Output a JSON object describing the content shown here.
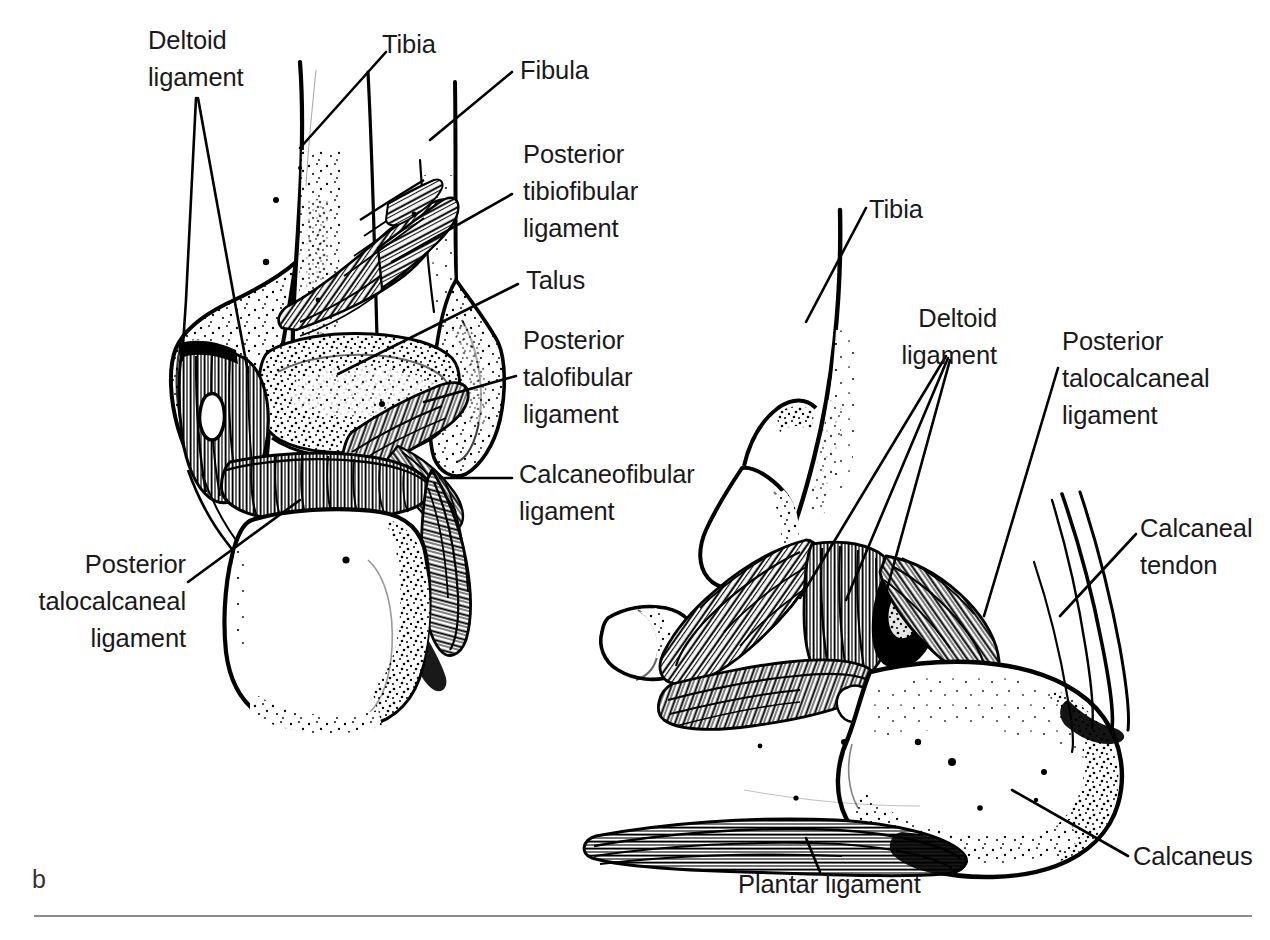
{
  "figure": {
    "panel_letter": "b",
    "caption_rule": true,
    "ink_color": "#000000",
    "text_color": "#1a1a1a",
    "rule_color": "#8d8d8d",
    "background": "#ffffff"
  },
  "left_view": {
    "name": "posterior-view-of-ankle",
    "labels": {
      "deltoid_ligament": "Deltoid\nligament",
      "tibia": "Tibia",
      "fibula": "Fibula",
      "posterior_tibiofibular_ligament": "Posterior\ntibiofibular\nligament",
      "talus": "Talus",
      "posterior_talofibular_ligament": "Posterior\ntalofibular\nligament",
      "calcaneofibular_ligament": "Calcaneofibular\nligament",
      "posterior_talocalcaneal_ligament": "Posterior\ntalocalcaneal\nligament"
    }
  },
  "right_view": {
    "name": "medial-view-of-ankle",
    "labels": {
      "tibia": "Tibia",
      "deltoid_ligament": "Deltoid\nligament",
      "posterior_talocalcaneal_ligament": "Posterior\ntalocalcaneal\nligament",
      "calcaneal_tendon": "Calcaneal\ntendon",
      "calcaneus": "Calcaneus",
      "plantar_ligament": "Plantar ligament"
    }
  }
}
